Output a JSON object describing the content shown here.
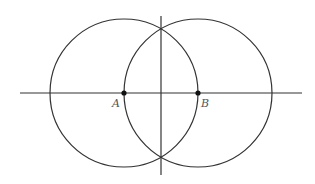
{
  "diagram": {
    "stroke_color": "#333333",
    "point_color": "#111111",
    "label_color": "#555555",
    "horizontal_line": {
      "x1": 20,
      "y1": 93,
      "x2": 302,
      "y2": 93
    },
    "vertical_line": {
      "x1": 161,
      "y1": 16,
      "x2": 161,
      "y2": 175
    },
    "circles": [
      {
        "name": "circle-centered-A",
        "cx": 124,
        "cy": 93,
        "r": 74
      },
      {
        "name": "circle-centered-B",
        "cx": 198,
        "cy": 93,
        "r": 74
      }
    ],
    "points": [
      {
        "name": "A",
        "label": "A",
        "x": 124,
        "y": 93,
        "label_x": 112,
        "label_y": 107
      },
      {
        "name": "B",
        "label": "B",
        "x": 198,
        "y": 93,
        "label_x": 201,
        "label_y": 107
      }
    ],
    "intersections": [
      {
        "name": "top-intersection",
        "x": 161,
        "y": 29
      },
      {
        "name": "bottom-intersection",
        "x": 161,
        "y": 157
      }
    ]
  }
}
